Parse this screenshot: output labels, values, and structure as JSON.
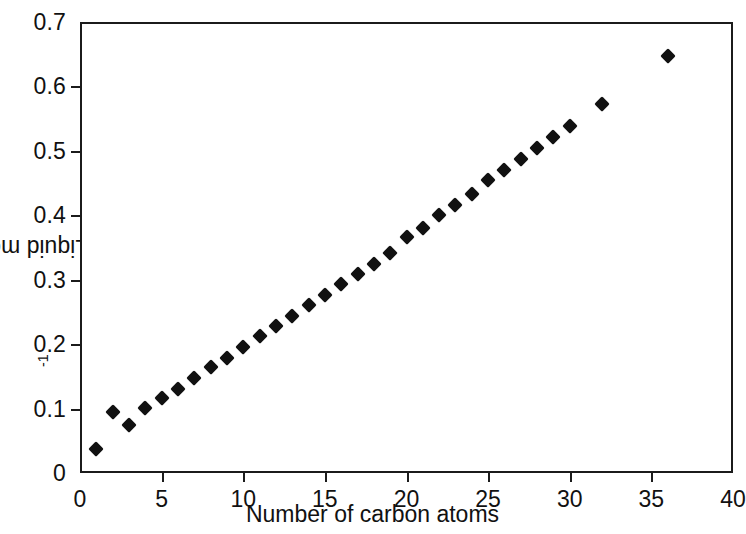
{
  "chart_data": {
    "type": "scatter",
    "title": "",
    "xlabel": "Number of carbon atoms",
    "ylabel_plain": "Liquid molar volume (m3 kmol-1)",
    "ylabel_parts": {
      "prefix": "Liquid molar volume (m",
      "sup1": "3",
      "middle": " kmol",
      "sup2": "-1",
      "suffix": ")"
    },
    "xlim": [
      0,
      40
    ],
    "ylim": [
      0,
      0.7
    ],
    "xticks": [
      0,
      5,
      10,
      15,
      20,
      25,
      30,
      35,
      40
    ],
    "xtick_labels": [
      "0",
      "5",
      "10",
      "15",
      "20",
      "25",
      "30",
      "35",
      "40"
    ],
    "yticks": [
      0,
      0.1,
      0.2,
      0.3,
      0.4,
      0.5,
      0.6,
      0.7
    ],
    "ytick_labels": [
      "0",
      "0.1",
      "0.2",
      "0.3",
      "0.4",
      "0.5",
      "0.6",
      "0.7"
    ],
    "grid": false,
    "legend": null,
    "marker": "diamond",
    "marker_color": "#111111",
    "series": [
      {
        "name": "n-alkanes",
        "x": [
          1,
          2,
          3,
          4,
          5,
          6,
          7,
          8,
          9,
          10,
          11,
          12,
          13,
          14,
          15,
          16,
          17,
          18,
          19,
          20,
          21,
          22,
          23,
          24,
          25,
          26,
          27,
          28,
          29,
          30,
          32,
          36
        ],
        "y": [
          0.038,
          0.095,
          0.075,
          0.101,
          0.116,
          0.131,
          0.147,
          0.164,
          0.179,
          0.196,
          0.212,
          0.228,
          0.244,
          0.261,
          0.277,
          0.293,
          0.309,
          0.325,
          0.342,
          0.367,
          0.381,
          0.4,
          0.416,
          0.433,
          0.455,
          0.47,
          0.487,
          0.504,
          0.521,
          0.538,
          0.573,
          0.647
        ]
      }
    ]
  }
}
